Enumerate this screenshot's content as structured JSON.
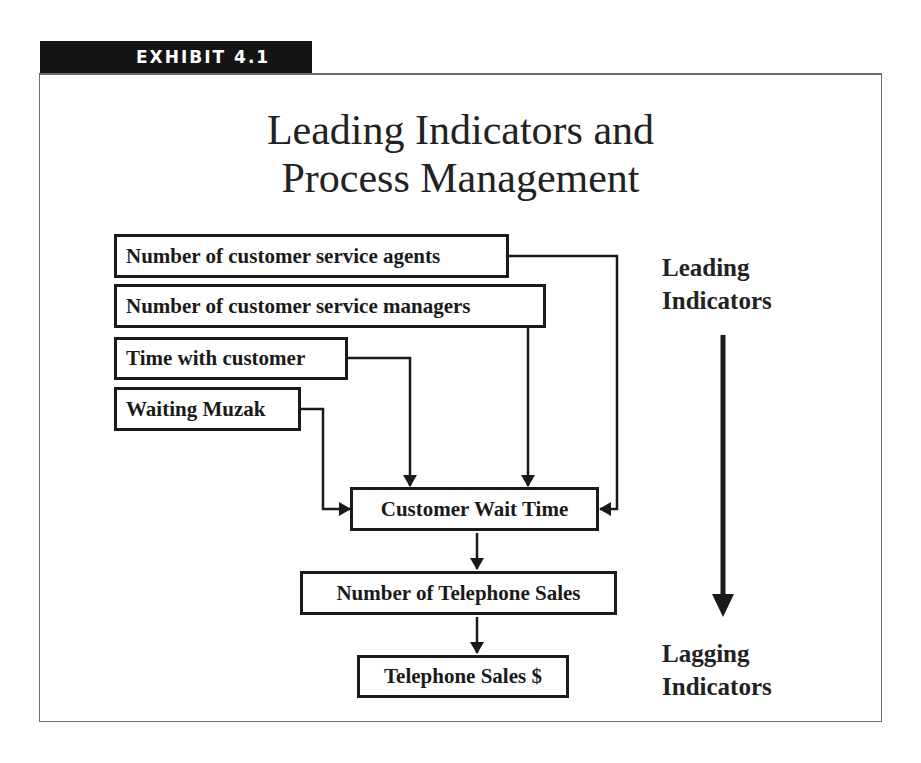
{
  "exhibit": {
    "label": "EXHIBIT 4.1",
    "tab_color": "#141414"
  },
  "title": {
    "line1": "Leading Indicators and",
    "line2": "Process Management"
  },
  "diagram": {
    "inputs": [
      {
        "id": "agents",
        "label": "Number of customer service agents"
      },
      {
        "id": "managers",
        "label": "Number of customer service managers"
      },
      {
        "id": "time",
        "label": "Time with customer"
      },
      {
        "id": "muzak",
        "label": "Waiting Muzak"
      }
    ],
    "chain": [
      {
        "id": "wait",
        "label": "Customer Wait Time"
      },
      {
        "id": "sales_count",
        "label": "Number of Telephone Sales"
      },
      {
        "id": "sales_dollars",
        "label": "Telephone Sales $"
      }
    ],
    "edges": [
      {
        "from": "agents",
        "to": "wait"
      },
      {
        "from": "managers",
        "to": "wait"
      },
      {
        "from": "time",
        "to": "wait"
      },
      {
        "from": "muzak",
        "to": "wait"
      },
      {
        "from": "wait",
        "to": "sales_count"
      },
      {
        "from": "sales_count",
        "to": "sales_dollars"
      }
    ]
  },
  "scale": {
    "top": {
      "line1": "Leading",
      "line2": "Indicators"
    },
    "bottom": {
      "line1": "Lagging",
      "line2": "Indicators"
    }
  }
}
